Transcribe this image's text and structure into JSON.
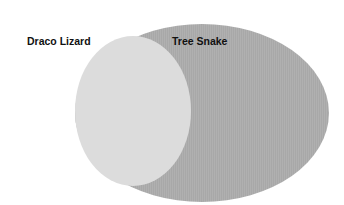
{
  "diagram": {
    "type": "venn",
    "sets": [
      {
        "name": "Draco Lizard",
        "color": "#dcdcdc"
      },
      {
        "name": "Tree Snake",
        "color": "#a9a9a9"
      }
    ],
    "relationship": "Draco Lizard set lies entirely within Tree Snake set"
  },
  "labels": {
    "set_a": "Draco Lizard",
    "set_b": "Tree Snake"
  }
}
